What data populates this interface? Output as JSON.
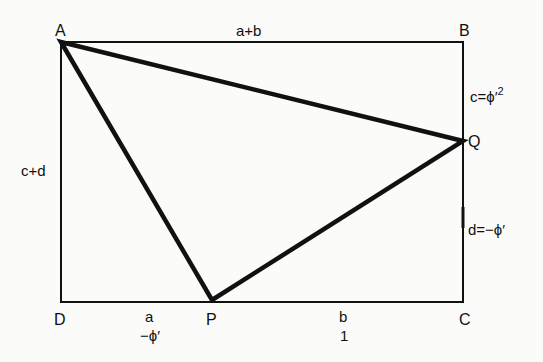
{
  "diagram": {
    "type": "geometry",
    "vertices": {
      "A": {
        "label": "A",
        "x": 61,
        "y": 42
      },
      "B": {
        "label": "B",
        "x": 463,
        "y": 42
      },
      "C": {
        "label": "C",
        "x": 463,
        "y": 302
      },
      "D": {
        "label": "D",
        "x": 61,
        "y": 302
      },
      "P": {
        "label": "P",
        "x": 212,
        "y": 300
      },
      "Q": {
        "label": "Q",
        "x": 463,
        "y": 141
      }
    },
    "labels": {
      "top": "a+b",
      "left": "c+d",
      "right_upper": "c=ϕ′²",
      "right_upper_base": "c=ϕ′",
      "right_upper_sup": "2",
      "right_lower": "d=−ϕ′",
      "bottom_left_top": "a",
      "bottom_left_bottom": "−ϕ′",
      "bottom_right_top": "b",
      "bottom_right_bottom": "1"
    },
    "colors": {
      "line": "#111111",
      "background": "#fbfbf9"
    }
  }
}
